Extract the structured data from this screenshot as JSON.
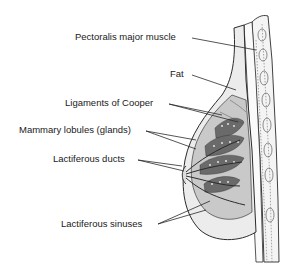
{
  "diagram": {
    "labels": [
      {
        "id": "pectoralis",
        "text": "Pectoralis major muscle"
      },
      {
        "id": "fat",
        "text": "Fat"
      },
      {
        "id": "cooper",
        "text": "Ligaments of Cooper"
      },
      {
        "id": "lobules",
        "text": "Mammary lobules (glands)"
      },
      {
        "id": "ducts",
        "text": "Lactiferous ducts"
      },
      {
        "id": "sinuses",
        "text": "Lactiferous sinuses"
      }
    ],
    "colors": {
      "background": "#ffffff",
      "ink": "#1a1a1a",
      "tissue_gray": "#c9c9c9",
      "fat_light": "#ececec",
      "lobule_dark": "#6a6a6a"
    }
  }
}
